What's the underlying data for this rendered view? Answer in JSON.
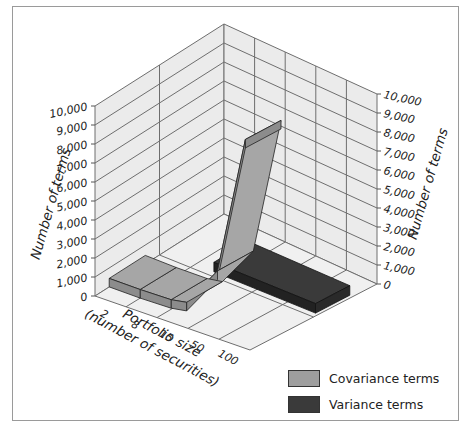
{
  "chart_data": {
    "type": "bar",
    "subtype": "3d-ribbon",
    "title": "",
    "xlabel": "Portfolio size (number of securities)",
    "xlabel_lines": [
      "Portfolio size",
      "(number of securities)"
    ],
    "ylabel": "Number of terms",
    "categories": [
      "2",
      "8",
      "15",
      "50",
      "100"
    ],
    "series": [
      {
        "name": "Covariance terms",
        "values": [
          2,
          56,
          210,
          2450,
          9900
        ],
        "color": "#9e9e9e"
      },
      {
        "name": "Variance terms",
        "values": [
          2,
          8,
          15,
          50,
          100
        ],
        "color": "#3a3a3a"
      }
    ],
    "ylim": [
      0,
      10000
    ],
    "yticks": [
      "0",
      "1,000",
      "2,000",
      "3,000",
      "4,000",
      "5,000",
      "6,000",
      "7,000",
      "8,000",
      "9,000",
      "10,000"
    ],
    "grid": true,
    "legend_position": "bottom-right"
  },
  "legend": {
    "items": [
      {
        "label": "Covariance terms",
        "color": "#9e9e9e"
      },
      {
        "label": "Variance terms",
        "color": "#3a3a3a"
      }
    ]
  }
}
